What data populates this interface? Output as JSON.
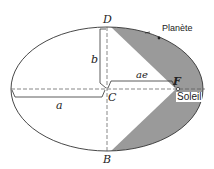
{
  "diagram": {
    "labels": {
      "D": "D",
      "B": "B",
      "C": "C",
      "F": "F",
      "a": "a",
      "b": "b",
      "ae": "ae",
      "planet": "Planète",
      "sun": "Soleil"
    },
    "colors": {
      "shade": "#9a9a9a",
      "line": "#333333"
    }
  }
}
